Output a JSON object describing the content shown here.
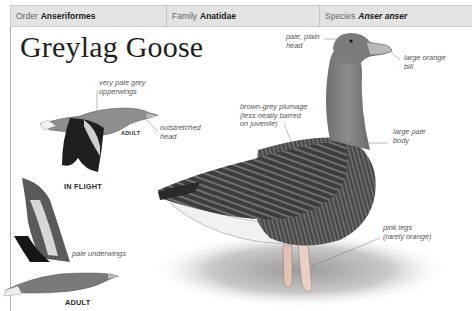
{
  "header": {
    "order_label": "Order",
    "order_value": "Anseriformes",
    "family_label": "Family",
    "family_value": "Anatidae",
    "species_label": "Species",
    "species_value": "Anser anser"
  },
  "title": "Greylag Goose",
  "flight_illustration": {
    "section_label": "IN FLIGHT",
    "top_bird_age": "ADULT",
    "bottom_bird_age": "ADULT",
    "annotations": {
      "upperwings": [
        "very pale grey",
        "upperwings"
      ],
      "head": [
        "outstretched",
        "head"
      ],
      "underwings": [
        "pale underwings"
      ]
    }
  },
  "main_illustration": {
    "annotations": {
      "head": [
        "pale, plain",
        "head"
      ],
      "bill": [
        "large orange",
        "bill"
      ],
      "plumage": [
        "brown-grey plumage",
        "(less neatly barred",
        "on juvenile)"
      ],
      "body": [
        "large pale",
        "body"
      ],
      "legs": [
        "pink legs",
        "(rarely orange)"
      ]
    }
  },
  "colors": {
    "header_bg": "#e3e3e3",
    "rule": "#b0b0b0",
    "bill": "#d99a6a",
    "legs": "#e3c2b5"
  }
}
